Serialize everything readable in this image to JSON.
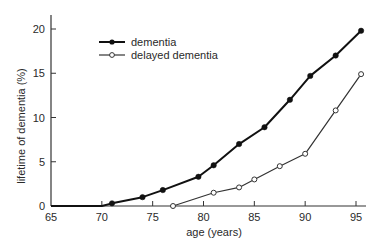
{
  "chart_data": {
    "type": "line",
    "title": "",
    "xlabel": "age (years)",
    "ylabel": "lifetime of dementia (%)",
    "xlim": [
      65,
      96
    ],
    "ylim": [
      0,
      21
    ],
    "xticks": [
      65,
      70,
      75,
      80,
      85,
      90,
      95
    ],
    "yticks": [
      0,
      5,
      10,
      15,
      20
    ],
    "grid": false,
    "legend_position": "upper left",
    "series": [
      {
        "name": "dementia",
        "marker": "filled-circle",
        "color": "#111111",
        "line_width": 2,
        "x": [
          65,
          70,
          71,
          74,
          76,
          79.5,
          81,
          83.5,
          86,
          88.5,
          90.5,
          93,
          95.5
        ],
        "y": [
          0,
          0,
          0.3,
          1.0,
          1.8,
          3.3,
          4.6,
          7.0,
          8.9,
          12.0,
          14.7,
          17.0,
          19.8
        ],
        "marker_x": [
          71,
          74,
          76,
          79.5,
          81,
          83.5,
          86,
          88.5,
          90.5,
          93,
          95.5
        ],
        "marker_y": [
          0.3,
          1.0,
          1.8,
          3.3,
          4.6,
          7.0,
          8.9,
          12.0,
          14.7,
          17.0,
          19.8
        ]
      },
      {
        "name": "delayed dementia",
        "marker": "open-circle",
        "color": "#333333",
        "line_width": 1.2,
        "x": [
          77,
          81,
          83.5,
          85,
          87.5,
          90,
          93,
          95.5
        ],
        "y": [
          0,
          1.5,
          2.1,
          3.0,
          4.5,
          5.9,
          10.8,
          14.9
        ],
        "marker_x": [
          77,
          81,
          83.5,
          85,
          87.5,
          90,
          93,
          95.5
        ],
        "marker_y": [
          0,
          1.5,
          2.1,
          3.0,
          4.5,
          5.9,
          10.8,
          14.9
        ]
      }
    ]
  },
  "legend": {
    "items": [
      {
        "label": "dementia"
      },
      {
        "label": "delayed dementia"
      }
    ]
  },
  "axes": {
    "xlabel": "age (years)",
    "ylabel": "lifetime of dementia (%)"
  }
}
